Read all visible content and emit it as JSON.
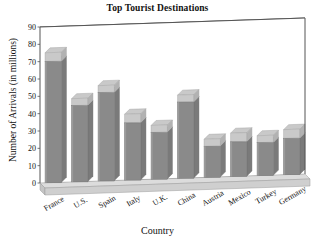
{
  "chart_data": {
    "type": "bar",
    "title": "Top Tourist Destinations",
    "xlabel": "Country",
    "ylabel": "Number of Arrivals (in millions)",
    "categories": [
      "France",
      "U.S.",
      "Spain",
      "Italy",
      "U.K.",
      "China",
      "Austria",
      "Mexico",
      "Turkey",
      "Germany"
    ],
    "values": [
      75,
      48,
      55,
      38,
      31,
      48,
      22,
      25,
      23,
      26
    ],
    "front_face_values": [
      70,
      44,
      51,
      33,
      27,
      44,
      18,
      20,
      19,
      21
    ],
    "ylim": [
      0,
      90
    ],
    "yticks": [
      0,
      10,
      20,
      30,
      40,
      50,
      60,
      70,
      80,
      90
    ],
    "ytick_labels": [
      "0",
      "10",
      "20",
      "30",
      "40",
      "50",
      "60",
      "70",
      "80",
      "90"
    ],
    "grid": true,
    "grid_axis": "y",
    "legend": false,
    "style": "3d-column",
    "bar_color": "#8a8a8a",
    "bar_top_color": "#c9c9c9",
    "floor_color": "#d4d4d4",
    "axis_color": "#555555",
    "grid_color": "#a8a8a8",
    "plot_background": "#ffffff",
    "xtick_rotation": -30
  }
}
